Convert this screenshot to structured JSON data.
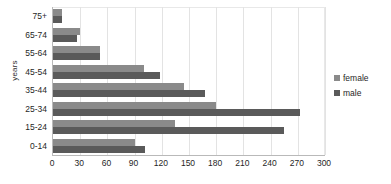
{
  "chart_data": {
    "type": "bar",
    "orientation": "horizontal",
    "title": "",
    "xlabel": "",
    "ylabel": "years",
    "categories": [
      "0-14",
      "15-24",
      "25-34",
      "35-44",
      "45-54",
      "55-64",
      "65-74",
      "75+"
    ],
    "series": [
      {
        "name": "female",
        "color": "#8a8a8a",
        "values": [
          90,
          135,
          180,
          145,
          100,
          52,
          30,
          10
        ]
      },
      {
        "name": "male",
        "color": "#5a5a5a",
        "values": [
          102,
          255,
          272,
          168,
          118,
          52,
          27,
          10
        ]
      }
    ],
    "xlim": [
      0,
      300
    ],
    "xticks": [
      0,
      30,
      60,
      90,
      120,
      150,
      180,
      210,
      240,
      270,
      300
    ],
    "xtick_labels": [
      "0",
      "30",
      "60",
      "90",
      "120",
      "150",
      "180",
      "210",
      "240",
      "270",
      "300"
    ],
    "grid": true,
    "grid_axis": "x",
    "legend_position": "right",
    "legend_entries": [
      "female",
      "male"
    ]
  },
  "axis": {
    "y_title": "years",
    "y_categories_top_to_bottom": [
      "75+",
      "65-74",
      "55-64",
      "45-54",
      "35-44",
      "25-34",
      "15-24",
      "0-14"
    ]
  },
  "legend": {
    "items": [
      {
        "label": "female",
        "swatch": "female-color-swatch"
      },
      {
        "label": "male",
        "swatch": "male-color-swatch"
      }
    ]
  },
  "colors": {
    "female": "#8a8a8a",
    "male": "#5a5a5a",
    "gridline": "#e3e3e3",
    "axis": "#b9b9b9",
    "background": "#ffffff",
    "text": "#1f1f1f"
  }
}
